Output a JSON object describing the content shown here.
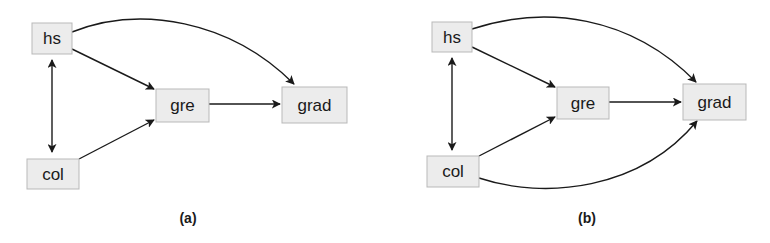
{
  "panels": [
    {
      "caption": "(a)",
      "nodes": {
        "hs": {
          "label": "hs"
        },
        "gre": {
          "label": "gre"
        },
        "grad": {
          "label": "grad"
        },
        "col": {
          "label": "col"
        }
      },
      "edges": [
        {
          "from": "hs",
          "to": "col",
          "type": "bidirectional"
        },
        {
          "from": "hs",
          "to": "gre",
          "type": "directed"
        },
        {
          "from": "col",
          "to": "gre",
          "type": "directed"
        },
        {
          "from": "gre",
          "to": "grad",
          "type": "directed"
        },
        {
          "from": "hs",
          "to": "grad",
          "type": "directed-curved"
        }
      ]
    },
    {
      "caption": "(b)",
      "nodes": {
        "hs": {
          "label": "hs"
        },
        "gre": {
          "label": "gre"
        },
        "grad": {
          "label": "grad"
        },
        "col": {
          "label": "col"
        }
      },
      "edges": [
        {
          "from": "hs",
          "to": "col",
          "type": "bidirectional"
        },
        {
          "from": "hs",
          "to": "gre",
          "type": "directed"
        },
        {
          "from": "col",
          "to": "gre",
          "type": "directed"
        },
        {
          "from": "gre",
          "to": "grad",
          "type": "directed"
        },
        {
          "from": "hs",
          "to": "grad",
          "type": "directed-curved"
        },
        {
          "from": "col",
          "to": "grad",
          "type": "directed-curved"
        }
      ]
    }
  ]
}
